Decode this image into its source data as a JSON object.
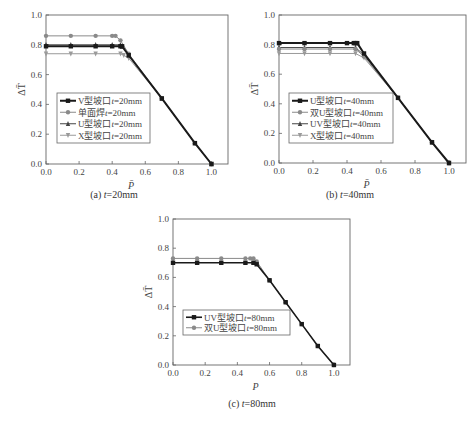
{
  "chart_data": [
    {
      "id": "a",
      "type": "line",
      "caption": {
        "prefix": "(a) ",
        "var": "t",
        "value": "=20mm"
      },
      "xlabel": "P̄",
      "ylabel": "ΔT̄",
      "xlim": [
        0,
        1.1
      ],
      "ylim": [
        0,
        1.0
      ],
      "xticks": [
        0.0,
        0.2,
        0.4,
        0.6,
        0.8,
        1.0
      ],
      "yticks": [
        0.0,
        0.2,
        0.4,
        0.6,
        0.8,
        1.0
      ],
      "grid": false,
      "legend_position": "center-left",
      "series": [
        {
          "name": "V型坡口t=20mm",
          "label_parts": [
            "V型坡口",
            "t",
            "=20mm"
          ],
          "color": "#1a1a1a",
          "marker": "square",
          "width": 2.0,
          "x": [
            0,
            0.15,
            0.3,
            0.4,
            0.45,
            0.46,
            0.5,
            0.7,
            0.9,
            1.0
          ],
          "y": [
            0.79,
            0.79,
            0.79,
            0.79,
            0.79,
            0.79,
            0.73,
            0.44,
            0.14,
            0.0
          ]
        },
        {
          "name": "单面焊t=20mm",
          "label_parts": [
            "单面焊",
            "t",
            "=20mm"
          ],
          "color": "#8a8a8a",
          "marker": "circle",
          "width": 1.0,
          "x": [
            0,
            0.15,
            0.3,
            0.4,
            0.42,
            0.45,
            0.5,
            0.7,
            0.9,
            1.0
          ],
          "y": [
            0.86,
            0.86,
            0.86,
            0.86,
            0.86,
            0.83,
            0.74,
            0.44,
            0.14,
            0.0
          ]
        },
        {
          "name": "U型坡口t=20mm",
          "label_parts": [
            "U型坡口",
            "t",
            "=20mm"
          ],
          "color": "#444444",
          "marker": "triangle-up",
          "width": 1.0,
          "x": [
            0,
            0.15,
            0.3,
            0.4,
            0.45,
            0.46,
            0.5,
            0.7,
            0.9,
            1.0
          ],
          "y": [
            0.8,
            0.8,
            0.8,
            0.8,
            0.8,
            0.79,
            0.73,
            0.44,
            0.14,
            0.0
          ]
        },
        {
          "name": "X型坡口t=20mm",
          "label_parts": [
            "X型坡口",
            "t",
            "=20mm"
          ],
          "color": "#9a9a9a",
          "marker": "triangle-down",
          "width": 1.0,
          "x": [
            0,
            0.15,
            0.3,
            0.45,
            0.47,
            0.5,
            0.7,
            0.9,
            1.0
          ],
          "y": [
            0.74,
            0.74,
            0.74,
            0.74,
            0.73,
            0.71,
            0.44,
            0.14,
            0.0
          ]
        }
      ]
    },
    {
      "id": "b",
      "type": "line",
      "caption": {
        "prefix": "(b) ",
        "var": "t",
        "value": "=40mm"
      },
      "xlabel": "P̄",
      "ylabel": "ΔT̄",
      "xlim": [
        0,
        1.1
      ],
      "ylim": [
        0,
        1.0
      ],
      "xticks": [
        0.0,
        0.2,
        0.4,
        0.6,
        0.8,
        1.0
      ],
      "yticks": [
        0.0,
        0.2,
        0.4,
        0.6,
        0.8,
        1.0
      ],
      "grid": false,
      "legend_position": "center-left",
      "series": [
        {
          "name": "U型坡口t=40mm",
          "label_parts": [
            "U型坡口",
            "t",
            "=40mm"
          ],
          "color": "#1a1a1a",
          "marker": "square",
          "width": 2.0,
          "x": [
            0,
            0.15,
            0.3,
            0.4,
            0.44,
            0.45,
            0.46,
            0.5,
            0.7,
            0.9,
            1.0
          ],
          "y": [
            0.81,
            0.81,
            0.81,
            0.81,
            0.81,
            0.81,
            0.81,
            0.74,
            0.44,
            0.14,
            0.0
          ]
        },
        {
          "name": "双U型坡口t=40mm",
          "label_parts": [
            "双U型坡口",
            "t",
            "=40mm"
          ],
          "color": "#8a8a8a",
          "marker": "circle",
          "width": 1.0,
          "x": [
            0,
            0.15,
            0.3,
            0.45,
            0.5,
            0.7,
            0.9,
            1.0
          ],
          "y": [
            0.77,
            0.77,
            0.77,
            0.77,
            0.72,
            0.44,
            0.14,
            0.0
          ]
        },
        {
          "name": "UV型坡口t=40mm",
          "label_parts": [
            "UV型坡口",
            "t",
            "=40mm"
          ],
          "color": "#444444",
          "marker": "triangle-up",
          "width": 1.0,
          "x": [
            0,
            0.15,
            0.3,
            0.45,
            0.5,
            0.7,
            0.9,
            1.0
          ],
          "y": [
            0.78,
            0.78,
            0.78,
            0.78,
            0.73,
            0.44,
            0.14,
            0.0
          ]
        },
        {
          "name": "X型坡口t=40mm",
          "label_parts": [
            "X型坡口",
            "t",
            "=40mm"
          ],
          "color": "#9a9a9a",
          "marker": "triangle-down",
          "width": 1.0,
          "x": [
            0,
            0.15,
            0.3,
            0.45,
            0.5,
            0.7,
            0.9,
            1.0
          ],
          "y": [
            0.74,
            0.74,
            0.74,
            0.74,
            0.71,
            0.44,
            0.14,
            0.0
          ]
        }
      ]
    },
    {
      "id": "c",
      "type": "line",
      "caption": {
        "prefix": "(c) ",
        "var": "t",
        "value": "=80mm"
      },
      "xlabel": "P",
      "ylabel": "ΔT̄",
      "xlim": [
        0,
        1.1
      ],
      "ylim": [
        0,
        1.0
      ],
      "xticks": [
        0.0,
        0.2,
        0.4,
        0.6,
        0.8,
        1.0
      ],
      "yticks": [
        0.0,
        0.2,
        0.4,
        0.6,
        0.8,
        1.0
      ],
      "grid": false,
      "legend_position": "center-left",
      "series": [
        {
          "name": "UV型坡口t=80mm",
          "label_parts": [
            "UV型坡口",
            "t",
            "=80mm"
          ],
          "color": "#1a1a1a",
          "marker": "square",
          "width": 1.6,
          "x": [
            0,
            0.15,
            0.3,
            0.45,
            0.5,
            0.52,
            0.6,
            0.7,
            0.8,
            0.9,
            1.0
          ],
          "y": [
            0.7,
            0.7,
            0.7,
            0.7,
            0.7,
            0.69,
            0.58,
            0.43,
            0.28,
            0.13,
            0.0
          ]
        },
        {
          "name": "双U型坡口t=80mm",
          "label_parts": [
            "双U型坡口",
            "t",
            "=80mm"
          ],
          "color": "#8a8a8a",
          "marker": "circle",
          "width": 1.0,
          "x": [
            0,
            0.15,
            0.3,
            0.45,
            0.48,
            0.5,
            0.52,
            0.6,
            0.7,
            0.8,
            0.9,
            1.0
          ],
          "y": [
            0.73,
            0.73,
            0.73,
            0.73,
            0.73,
            0.73,
            0.71,
            0.58,
            0.43,
            0.28,
            0.13,
            0.0
          ]
        }
      ]
    }
  ],
  "layout": {
    "panels": [
      {
        "id": "a",
        "frame": {
          "x0": 46,
          "y0": 15,
          "x1": 228,
          "y1": 164
        },
        "legend": {
          "x": 57,
          "y": 93,
          "w": 93,
          "h": 50
        },
        "caption_pos": {
          "x": 105,
          "y": 196
        }
      },
      {
        "id": "b",
        "frame": {
          "x0": 279,
          "y0": 15,
          "x1": 466,
          "y1": 163
        },
        "legend": {
          "x": 289,
          "y": 93,
          "w": 104,
          "h": 50
        },
        "caption_pos": {
          "x": 342,
          "y": 196
        }
      },
      {
        "id": "c",
        "frame": {
          "x0": 173,
          "y0": 219,
          "x1": 350,
          "y1": 365
        },
        "legend": {
          "x": 183,
          "y": 310,
          "w": 107,
          "h": 25
        },
        "caption_pos": {
          "x": 240,
          "y": 403
        }
      }
    ]
  }
}
